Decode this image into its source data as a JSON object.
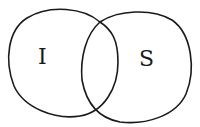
{
  "diagram": {
    "type": "venn",
    "sets": [
      {
        "label": "I",
        "cx": 60,
        "cy": 60,
        "rx": 56,
        "ry": 56
      },
      {
        "label": "S",
        "cx": 137,
        "cy": 65,
        "rx": 56,
        "ry": 56
      }
    ],
    "stroke_color": "#1a1a1a",
    "background": "#ffffff"
  }
}
